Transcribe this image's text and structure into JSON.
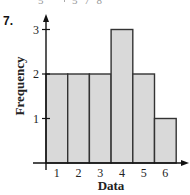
{
  "problem_number": "7.",
  "top_fragment": {
    "stem": "5",
    "leaves": "5 7 8"
  },
  "chart_data": {
    "type": "bar",
    "subtype": "histogram",
    "title": "",
    "xlabel": "Data",
    "ylabel": "Frequency",
    "categories": [
      "1",
      "2",
      "3",
      "4",
      "5",
      "6"
    ],
    "values": [
      2,
      2,
      2,
      3,
      2,
      1
    ],
    "ylim": [
      0,
      3
    ],
    "yticks": [
      "1",
      "2",
      "3"
    ],
    "xticks": [
      "1",
      "2",
      "3",
      "4",
      "5",
      "6"
    ],
    "grid": false,
    "legend": null,
    "bar_fill": "#d9d9d9",
    "bar_stroke": "#333333",
    "axis_color": "#111111"
  }
}
